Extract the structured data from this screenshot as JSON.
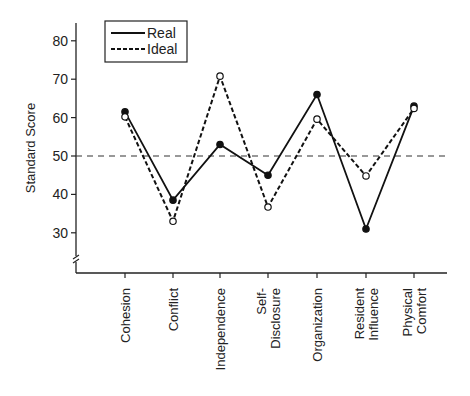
{
  "chart_data": {
    "type": "line",
    "title": "",
    "xlabel": "",
    "ylabel": "Standard Score",
    "ylim": [
      22,
      85
    ],
    "yticks": [
      30,
      40,
      50,
      60,
      70,
      80
    ],
    "axis_break": true,
    "reference_line": {
      "y": 50,
      "style": "dashed"
    },
    "categories": [
      "Cohesion",
      "Conflict",
      "Independence",
      "Self-Disclosure",
      "Organization",
      "Resident Influence",
      "Physical Comfort"
    ],
    "category_label_lines": [
      [
        "Cohesion"
      ],
      [
        "Conflict"
      ],
      [
        "Independence"
      ],
      [
        "Self-",
        "Disclosure"
      ],
      [
        "Organization"
      ],
      [
        "Resident",
        "Influence"
      ],
      [
        "Physical",
        "Comfort"
      ]
    ],
    "series": [
      {
        "name": "Real",
        "style": "solid",
        "marker": "filled-circle",
        "values": [
          61.5,
          38.5,
          53,
          45,
          66,
          31,
          63
        ]
      },
      {
        "name": "Ideal",
        "style": "dashed",
        "marker": "open-circle",
        "values": [
          60.2,
          33,
          70.8,
          36.7,
          59.6,
          44.8,
          62.4
        ]
      }
    ],
    "legend": {
      "position": "upper-left",
      "entries": [
        "Real",
        "Ideal"
      ]
    },
    "grid": false
  }
}
